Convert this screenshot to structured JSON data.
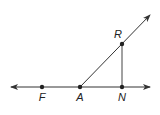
{
  "diagram": {
    "type": "geometry",
    "colors": {
      "line": "#333333",
      "point": "#222222",
      "background": "#ffffff"
    },
    "points": [
      {
        "label": "F",
        "x": 42,
        "y": 87,
        "label_x": 42,
        "label_y": 101
      },
      {
        "label": "A",
        "x": 80,
        "y": 87,
        "label_x": 80,
        "label_y": 101
      },
      {
        "label": "N",
        "x": 122,
        "y": 87,
        "label_x": 122,
        "label_y": 101
      },
      {
        "label": "R",
        "x": 122,
        "y": 44,
        "label_x": 118,
        "label_y": 38
      }
    ],
    "lines": [
      {
        "name": "line-FN",
        "from": [
          11,
          87
        ],
        "to": [
          150,
          87
        ],
        "arrows": "both"
      },
      {
        "name": "ray-AR",
        "from": [
          80,
          87
        ],
        "to": [
          150,
          15
        ],
        "arrows": "end"
      },
      {
        "name": "segment-RN",
        "from": [
          122,
          44
        ],
        "to": [
          122,
          87
        ],
        "arrows": "none"
      }
    ]
  }
}
